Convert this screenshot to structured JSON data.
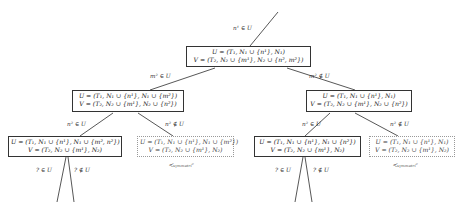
{
  "diagram": {
    "nodes": {
      "root": {
        "u": "U = (T₁, N₁ ∪ {n¹}, N₁)",
        "v": "V = (T₂, N₂ ∪ {m¹}, N₂ ∪ {n², m²})"
      },
      "left": {
        "u": "U = (T₁, N₁ ∪ {n¹}, N₁ ∪ {m²})",
        "v": "V = (T₂, N₂ ∪ {m¹}, N₂ ∪ {n²})"
      },
      "right": {
        "u": "U = (T₁, N₁ ∪ {n¹}, N₁)",
        "v": "V = (T₂, N₂ ∪ {m¹}, N₂ ∪ {n²})"
      },
      "left_left": {
        "u": "U = (T₁, N₁ ∪ {n¹}, N₁ ∪ {m², n²})",
        "v": "V = (T₂, N₂ ∪ {m¹}, N₂)"
      },
      "left_right": {
        "u": "U = (T₁, N₁ ∪ {n¹}, N₁ ∪ {m²})",
        "v": "V = (T₂, N₂ ∪ {m¹}, N₂)"
      },
      "right_left": {
        "u": "U = (T₁, N₁ ∪ {n¹}, N₁ ∪ {n²})",
        "v": "V = (T₂, N₂ ∪ {m¹}, N₂)"
      },
      "right_right": {
        "u": "U = (T₁, N₁ ∪ {n¹}, N₁)",
        "v": "V = (T₂, N₂ ∪ {m¹}, N₂)"
      }
    },
    "edge_labels": {
      "top": "n¹ ∈ U",
      "root_left": "m² ∈ U",
      "root_right": "m² ∉ U",
      "left_left": "n² ∈ U",
      "left_right": "n² ∉ U",
      "right_left": "n² ∈ U",
      "right_right": "n² ∉ U",
      "ll_in": "? ∈ U",
      "ll_out": "? ∉ U",
      "rl_in": "? ∈ U",
      "rl_out": "? ∉ U"
    },
    "annotations": {
      "left_symmetric": "≺ₛᵧₘₘₑₜᵣᵢᶜ",
      "right_symmetric": "≺ₛᵧₘₘₑₜᵣᵢᶜ"
    }
  }
}
